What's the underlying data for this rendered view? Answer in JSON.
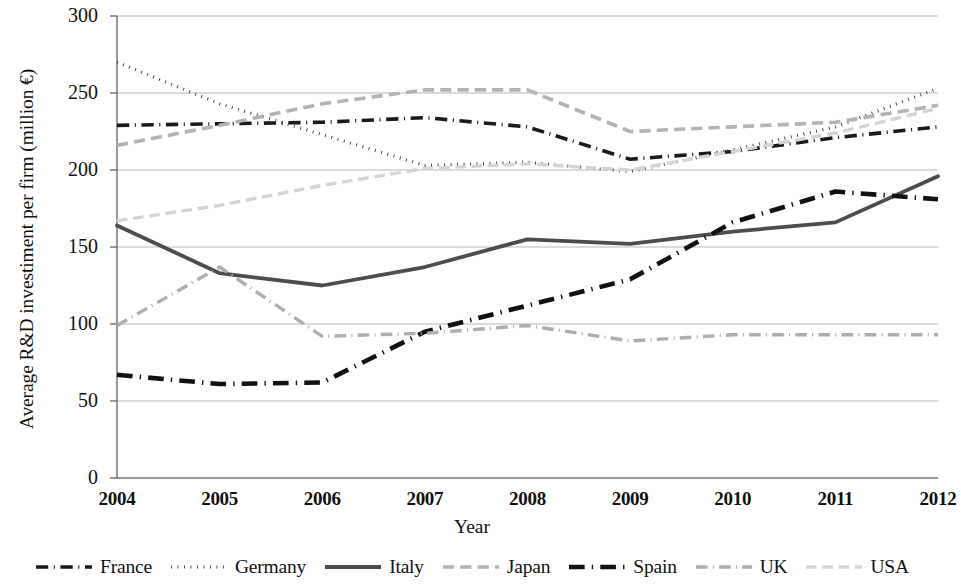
{
  "chart_data": {
    "type": "line",
    "title": "",
    "xlabel": "Year",
    "ylabel": "Average R&D investiment per firm (million €)",
    "categories": [
      "2004",
      "2005",
      "2006",
      "2007",
      "2008",
      "2009",
      "2010",
      "2011",
      "2012"
    ],
    "x": [
      2004,
      2005,
      2006,
      2007,
      2008,
      2009,
      2010,
      2011,
      2012
    ],
    "xlim": [
      2004,
      2012
    ],
    "ylim": [
      0,
      300
    ],
    "yticks": [
      0,
      50,
      100,
      150,
      200,
      250,
      300
    ],
    "grid": true,
    "legend_position": "bottom",
    "series": [
      {
        "name": "France",
        "values": [
          229,
          230,
          231,
          234,
          228,
          207,
          212,
          221,
          228
        ],
        "color": "#1a1a1a",
        "style": "dashdot",
        "width": 3.6
      },
      {
        "name": "Germany",
        "values": [
          270,
          243,
          223,
          203,
          205,
          199,
          213,
          228,
          253
        ],
        "color": "#3a3a3a",
        "style": "dotted",
        "width": 3.2
      },
      {
        "name": "Italy",
        "values": [
          164,
          133,
          125,
          137,
          155,
          152,
          160,
          166,
          196
        ],
        "color": "#4d4d4d",
        "style": "solid",
        "width": 3.8
      },
      {
        "name": "Japan",
        "values": [
          216,
          229,
          243,
          252,
          252,
          225,
          228,
          231,
          242
        ],
        "color": "#b3b3b3",
        "style": "dashed",
        "width": 3.6
      },
      {
        "name": "Spain",
        "values": [
          67,
          61,
          62,
          95,
          112,
          129,
          166,
          186,
          181
        ],
        "color": "#111111",
        "style": "dashdot",
        "width": 4.6
      },
      {
        "name": "UK",
        "values": [
          99,
          137,
          92,
          94,
          99,
          89,
          93,
          93,
          93
        ],
        "color": "#adadad",
        "style": "dashdot",
        "width": 3.4
      },
      {
        "name": "USA",
        "values": [
          167,
          177,
          190,
          201,
          204,
          200,
          212,
          224,
          240
        ],
        "color": "#d4d4d4",
        "style": "dashed",
        "width": 3.4
      }
    ]
  },
  "axes": {
    "y_tick_labels": [
      "300",
      "250",
      "200",
      "150",
      "100",
      "50",
      "0"
    ],
    "x_tick_labels": [
      "2004",
      "2005",
      "2006",
      "2007",
      "2008",
      "2009",
      "2010",
      "2011",
      "2012"
    ],
    "y_axis_title": "Average R&D investiment per firm (million €)",
    "x_axis_title": "Year"
  },
  "legend": {
    "items": [
      {
        "label": "France"
      },
      {
        "label": "Germany"
      },
      {
        "label": "Italy"
      },
      {
        "label": "Japan"
      },
      {
        "label": "Spain"
      },
      {
        "label": "UK"
      },
      {
        "label": "USA"
      }
    ]
  }
}
